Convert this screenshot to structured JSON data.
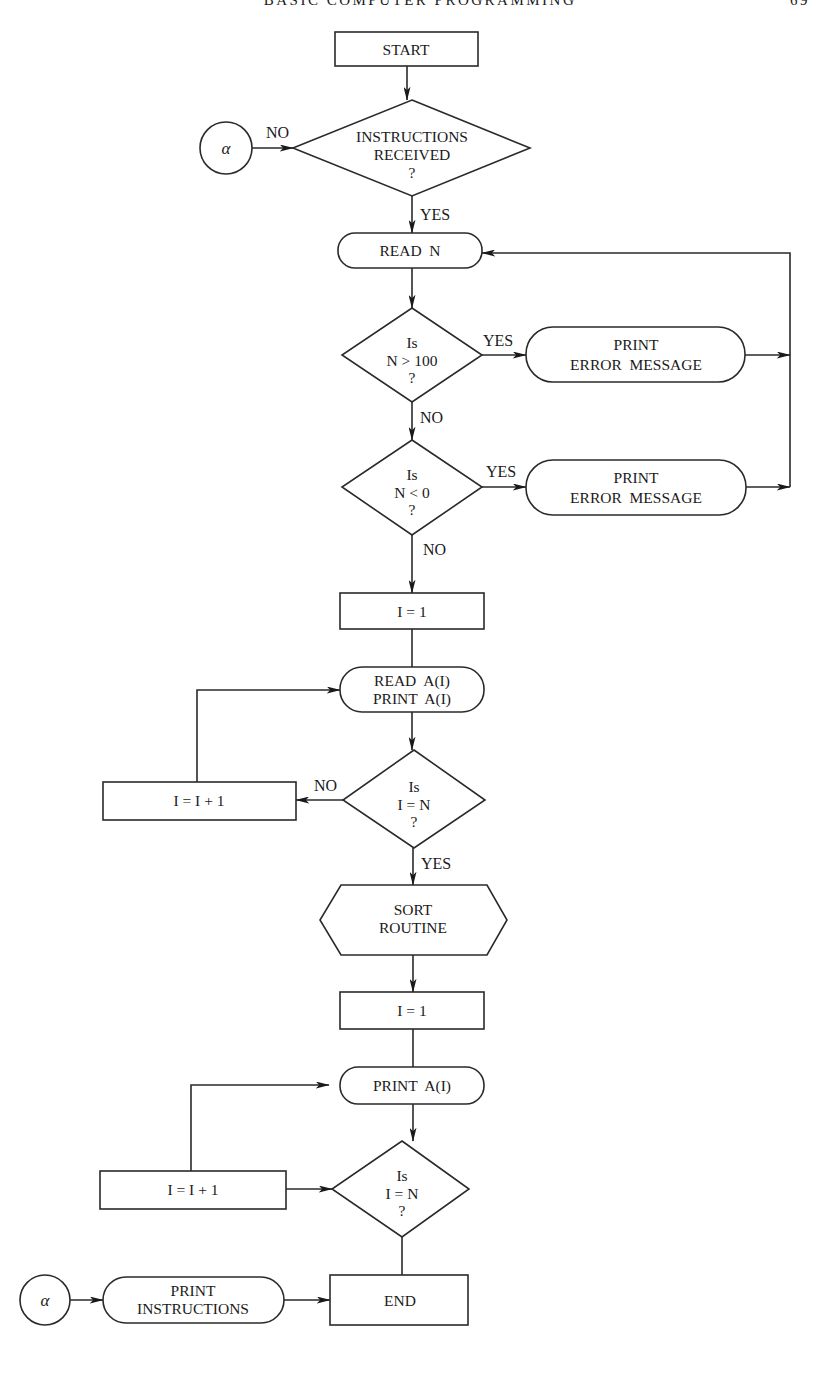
{
  "header": {
    "running_title": "BASIC COMPUTER PROGRAMMING",
    "page_number": "69"
  },
  "flowchart": {
    "nodes": {
      "start": {
        "type": "terminal-rect",
        "lines": [
          "START"
        ]
      },
      "instructions_received": {
        "type": "decision",
        "lines": [
          "INSTRUCTIONS",
          "RECEIVED",
          "?"
        ]
      },
      "connector_alpha_in": {
        "type": "connector",
        "lines": [
          "α"
        ]
      },
      "read_n": {
        "type": "io-rounded",
        "lines": [
          "READ  N"
        ]
      },
      "is_n_gt_100": {
        "type": "decision",
        "lines": [
          "Is",
          "N > 100",
          "?"
        ]
      },
      "print_error_1": {
        "type": "io-rounded",
        "lines": [
          "PRINT",
          "ERROR  MESSAGE"
        ]
      },
      "is_n_lt_0": {
        "type": "decision",
        "lines": [
          "Is",
          "N < 0",
          "?"
        ]
      },
      "print_error_2": {
        "type": "io-rounded",
        "lines": [
          "PRINT",
          "ERROR  MESSAGE"
        ]
      },
      "init_i_1": {
        "type": "process",
        "lines": [
          "I = 1"
        ]
      },
      "read_print_a": {
        "type": "io-rounded",
        "lines": [
          "READ  A(I)",
          "PRINT  A(I)"
        ]
      },
      "is_i_eq_n_1": {
        "type": "decision",
        "lines": [
          "Is",
          "I = N",
          "?"
        ]
      },
      "increment_1": {
        "type": "process",
        "lines": [
          "I = I + 1"
        ]
      },
      "sort_routine": {
        "type": "predefined-hexagon",
        "lines": [
          "SORT",
          "ROUTINE"
        ]
      },
      "init_i_2": {
        "type": "process",
        "lines": [
          "I = 1"
        ]
      },
      "print_a": {
        "type": "io-rounded",
        "lines": [
          "PRINT  A(I)"
        ]
      },
      "is_i_eq_n_2": {
        "type": "decision",
        "lines": [
          "Is",
          "I = N",
          "?"
        ]
      },
      "increment_2": {
        "type": "process",
        "lines": [
          "I = I + 1"
        ]
      },
      "end": {
        "type": "terminal-rect",
        "lines": [
          "END"
        ]
      },
      "connector_alpha_out": {
        "type": "connector",
        "lines": [
          "α"
        ]
      },
      "print_instructions": {
        "type": "io-rounded",
        "lines": [
          "PRINT",
          "INSTRUCTIONS"
        ]
      }
    },
    "edge_labels": {
      "instructions_no": "NO",
      "instructions_yes": "YES",
      "gt100_yes": "YES",
      "gt100_no": "NO",
      "lt0_yes": "YES",
      "lt0_no": "NO",
      "loop1_no": "NO",
      "loop1_yes": "YES"
    },
    "edges": [
      {
        "from": "start",
        "to": "instructions_received"
      },
      {
        "from": "connector_alpha_in",
        "to": "instructions_received",
        "label": "NO"
      },
      {
        "from": "instructions_received",
        "to": "read_n",
        "label": "YES"
      },
      {
        "from": "read_n",
        "to": "is_n_gt_100"
      },
      {
        "from": "is_n_gt_100",
        "to": "print_error_1",
        "label": "YES"
      },
      {
        "from": "print_error_1",
        "to": "read_n"
      },
      {
        "from": "is_n_gt_100",
        "to": "is_n_lt_0",
        "label": "NO"
      },
      {
        "from": "is_n_lt_0",
        "to": "print_error_2",
        "label": "YES"
      },
      {
        "from": "print_error_2",
        "to": "read_n"
      },
      {
        "from": "is_n_lt_0",
        "to": "init_i_1",
        "label": "NO"
      },
      {
        "from": "init_i_1",
        "to": "read_print_a"
      },
      {
        "from": "read_print_a",
        "to": "is_i_eq_n_1"
      },
      {
        "from": "is_i_eq_n_1",
        "to": "increment_1",
        "label": "NO"
      },
      {
        "from": "increment_1",
        "to": "read_print_a"
      },
      {
        "from": "is_i_eq_n_1",
        "to": "sort_routine",
        "label": "YES"
      },
      {
        "from": "sort_routine",
        "to": "init_i_2"
      },
      {
        "from": "init_i_2",
        "to": "print_a"
      },
      {
        "from": "print_a",
        "to": "is_i_eq_n_2"
      },
      {
        "from": "increment_2",
        "to": "is_i_eq_n_2"
      },
      {
        "from": "increment_2",
        "to": "print_a"
      },
      {
        "from": "is_i_eq_n_2",
        "to": "end"
      },
      {
        "from": "connector_alpha_out",
        "to": "print_instructions"
      },
      {
        "from": "print_instructions",
        "to": "end"
      }
    ]
  }
}
